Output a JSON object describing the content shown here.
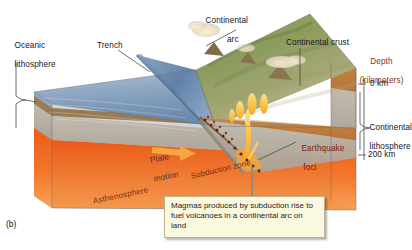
{
  "figure": {
    "panel_label": "(b)",
    "caption": "Magmas produced by subduction rise to fuel volcanoes in a continental arc on land"
  },
  "labels": {
    "oceanic_lithosphere_line1": "Oceanic",
    "oceanic_lithosphere_line2": "lithosphere",
    "trench": "Trench",
    "continental_arc_line1": "Continental",
    "continental_arc_line2": "arc",
    "continental_crust": "Continental crust",
    "depth_line1": "Depth",
    "depth_line2": "(kilometers)",
    "depth_tick_0": "0 km",
    "depth_tick_200": "200 km",
    "continental_lithosphere_line1": "Continental",
    "continental_lithosphere_line2": "lithosphere",
    "plate_motion_line1": "Plate",
    "plate_motion_line2": "motion",
    "subduction_zone": "Subduction zone",
    "earthquake_foci_line1": "Earthquake",
    "earthquake_foci_line2": "foci",
    "asthenosphere": "Asthenosphere"
  },
  "colors": {
    "ocean_top": "#9fb4cc",
    "ocean_deep": "#5d7ea6",
    "land_green": "#8fa163",
    "land_tan": "#b8ae7e",
    "crust_brown": "#c07f3c",
    "lithosphere_gray": "#b9b2a6",
    "asthenosphere_orange": "#ef5f1e",
    "asthenosphere_light": "#f4934a",
    "magma_yellow": "#f7c84a",
    "quake_dot": "#6d2008",
    "arrow_orange": "#f4a742",
    "callout_bg": "#fbf8e0",
    "depth_text": "#8d2f14",
    "leader_line": "#4a4a4a"
  },
  "depth_scale": {
    "unit": "km",
    "ticks": [
      0,
      200
    ]
  }
}
